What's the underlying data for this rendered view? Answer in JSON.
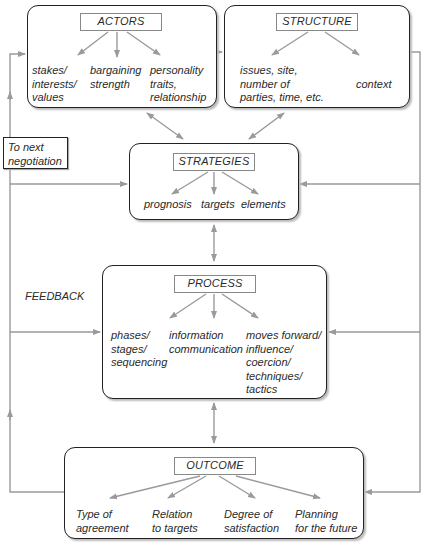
{
  "actors": {
    "title": "ACTORS",
    "items": [
      "stakes/\ninterests/\nvalues",
      "bargaining\nstrength",
      "personality\ntraits,\nrelationship"
    ]
  },
  "structure": {
    "title": "STRUCTURE",
    "items": [
      "issues, site,\nnumber of\nparties, time, etc.",
      "context"
    ]
  },
  "strategies": {
    "title": "STRATEGIES",
    "items": [
      "prognosis",
      "targets",
      "elements"
    ]
  },
  "process": {
    "title": "PROCESS",
    "items": [
      "phases/\nstages/\nsequencing",
      "information\ncommunication",
      "moves forward/\ninfluence/\ncoercion/\ntechniques/\ntactics"
    ]
  },
  "outcome": {
    "title": "OUTCOME",
    "items": [
      "Type of\nagreement",
      "Relation\nto targets",
      "Degree of\nsatisfaction",
      "Planning\nfor the future"
    ]
  },
  "annotations": {
    "next_negotiation": "To next\nnegotiation",
    "feedback": "FEEDBACK"
  },
  "colors": {
    "arrow": "#9a9a9a",
    "border": "#222222",
    "label_border": "#888888"
  }
}
